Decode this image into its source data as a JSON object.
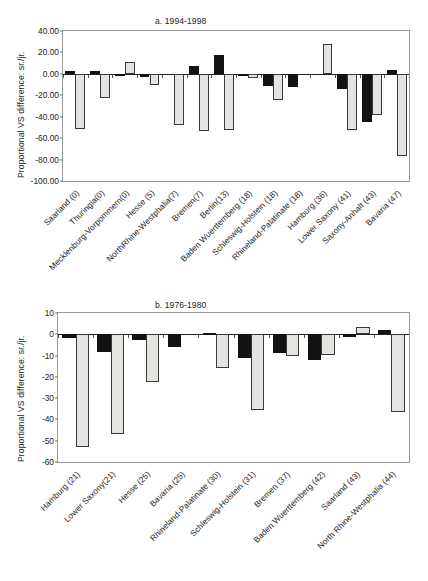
{
  "figure": {
    "ylabel": "Proportional VS difference: sr./jr.",
    "bar_colors": {
      "senior": "#121212",
      "junior": "#e3e3e0"
    }
  },
  "chart_data": [
    {
      "type": "bar",
      "title": "a. 1994-1998",
      "xlabel": "",
      "ylabel": "Proportional VS difference: sr./jr.",
      "ylim": [
        -100,
        40
      ],
      "yticks": [
        "40.00",
        "20.00",
        "0.00",
        "-20.00",
        "-40.00",
        "-60.00",
        "-80.00",
        "-100.00"
      ],
      "ytick_values": [
        40,
        20,
        0,
        -20,
        -40,
        -60,
        -80,
        -100
      ],
      "grid": false,
      "legend": "none",
      "categories": [
        "Saarland (0)",
        "Thuringia(0)",
        "Mecklenburg-Vorpommern(0)",
        "Hesse (5)",
        "NorthRhine-Westphalia(7)",
        "Bremen(7)",
        "Berlin(13)",
        "Baden Wuerttemberg (18)",
        "Schleswig-Holstein (18)",
        "Rhineland-Palatinate (18)",
        "Hamburg (36)",
        "Lower Saxony (41)",
        "Saxony-Anhalt (43)",
        "Bavaria (47)"
      ],
      "series": [
        {
          "name": "senior",
          "values": [
            3.0,
            3.0,
            -1.5,
            -2.5,
            -0.5,
            7.0,
            18.0,
            -1.0,
            -11.0,
            -12.5,
            -0.5,
            -14.0,
            -44.5,
            3.5
          ]
        },
        {
          "name": "junior",
          "values": [
            -51.5,
            -22.5,
            11.5,
            -10.0,
            -48.0,
            -53.5,
            -52.5,
            -4.0,
            -24.0,
            0.0,
            27.5,
            -52.5,
            -38.0,
            -76.5
          ]
        }
      ]
    },
    {
      "type": "bar",
      "title": "b. 1976-1980",
      "xlabel": "",
      "ylabel": "Proportional VS difference: sr./jr.",
      "ylim": [
        -60,
        10
      ],
      "yticks": [
        "10",
        "0",
        "-10",
        "-20",
        "-30",
        "-40",
        "-50",
        "-60"
      ],
      "ytick_values": [
        10,
        0,
        -10,
        -20,
        -30,
        -40,
        -50,
        -60
      ],
      "grid": false,
      "legend": "none",
      "categories": [
        "Hamburg (21)",
        "Lower Saxony(21)",
        "Hesse (25)",
        "Bavaria (25)",
        "Rhineland-Palatinate (30)",
        "Schleswig-Holstein (31)",
        "Bremen (37)",
        "Baden Wuerttemberg (42)",
        "Saarland (43)",
        "North Rhine-Westphalia (44)"
      ],
      "series": [
        {
          "name": "senior",
          "values": [
            -1.8,
            -8.2,
            -2.5,
            -6.0,
            0.7,
            -11.2,
            -9.0,
            -12.0,
            -1.5,
            2.0
          ]
        },
        {
          "name": "junior",
          "values": [
            -53.0,
            -47.0,
            -22.5,
            0.0,
            -16.0,
            -35.5,
            -10.2,
            -9.5,
            3.5,
            -36.5
          ]
        }
      ]
    }
  ]
}
